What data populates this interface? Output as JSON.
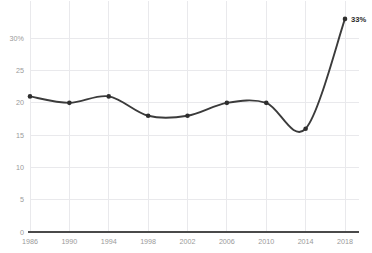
{
  "chart_data": {
    "type": "line",
    "title": "",
    "subtitle": "",
    "xlabel": "",
    "ylabel": "",
    "categories": [
      1986,
      1990,
      1994,
      1998,
      2002,
      2006,
      2010,
      2014,
      2018
    ],
    "x": [
      1986,
      1990,
      1994,
      1998,
      2002,
      2006,
      2010,
      2014,
      2018
    ],
    "values": [
      21,
      20,
      21,
      18,
      18,
      20,
      20,
      16,
      33
    ],
    "series": [
      {
        "name": "",
        "values": [
          21,
          20,
          21,
          18,
          18,
          20,
          20,
          16,
          33
        ]
      }
    ],
    "xlim": [
      1986,
      2018
    ],
    "ylim": [
      0,
      33
    ],
    "x_tick_labels": [
      "1986",
      "1990",
      "1994",
      "1998",
      "2002",
      "2006",
      "2010",
      "2014",
      "2018"
    ],
    "y_ticks": [
      0,
      5,
      10,
      15,
      20,
      25,
      30
    ],
    "y_tick_labels": [
      "0",
      "5",
      "10",
      "15",
      "20",
      "25",
      "30%"
    ],
    "grid": true,
    "grid_axes": "both",
    "legend": false,
    "legend_position": "none",
    "markers": true,
    "interpolation": "smooth",
    "annotations": [
      {
        "name": "final-value-label",
        "text": "33%",
        "x": 2018,
        "y": 33
      }
    ],
    "colors": {
      "line": "#3b3b3b",
      "marker": "#2e2e2e",
      "grid": "#e9e9ec",
      "axis": "#4a4a4a",
      "tick_label": "#9a9a9a",
      "annotation": "#2b2b2b",
      "background": "#ffffff"
    }
  }
}
